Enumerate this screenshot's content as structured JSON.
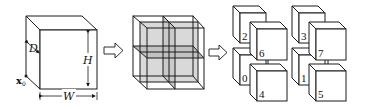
{
  "diagram": {
    "stages": [
      {
        "name": "bounding-box",
        "labels": {
          "depth": "D",
          "height": "H",
          "width": "W",
          "origin": "x",
          "origin_subscript": "0"
        }
      },
      {
        "name": "subdivided-box",
        "subdivisions": 8
      },
      {
        "name": "octant-cubes",
        "cube_labels": [
          "0",
          "1",
          "2",
          "3",
          "4",
          "5",
          "6",
          "7"
        ]
      }
    ],
    "arrows": [
      "stage1-to-stage2",
      "stage2-to-stage3"
    ],
    "colors": {
      "stroke": "#1a1a1a",
      "fill": "#ffffff",
      "shade_light": "#d9d9d9",
      "shade_dark": "#a8a8a8"
    }
  }
}
